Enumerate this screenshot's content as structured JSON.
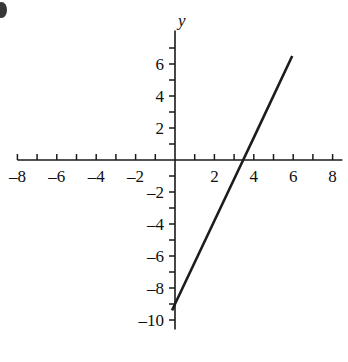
{
  "figure": {
    "corner_mark": "partial-label-cutoff"
  },
  "chart_data": {
    "type": "line",
    "title": "",
    "subtitle": "",
    "xlabel": "x",
    "ylabel": "y",
    "xlim": [
      -8.8,
      8.6
    ],
    "ylim": [
      -10.6,
      7.2
    ],
    "grid": false,
    "legend": null,
    "x_ticks_major": [
      -8,
      -6,
      -4,
      -2,
      2,
      4,
      6,
      8
    ],
    "y_ticks_major": [
      6,
      4,
      2,
      -2,
      -4,
      -6,
      -8,
      -10
    ],
    "x_tick_labels": [
      "–8",
      "–6",
      "–4",
      "–2",
      "2",
      "4",
      "6",
      "8"
    ],
    "y_tick_labels": [
      "6",
      "4",
      "2",
      "–2",
      "–4",
      "–6",
      "–8",
      "–10"
    ],
    "x_tick_step_minor": 1,
    "y_tick_step_minor": 1,
    "series": [
      {
        "name": "line",
        "slope": 2.6,
        "y_intercept": -9,
        "x_intercept": 3.46,
        "x_start": -0.15,
        "y_start": -9.4,
        "x_end": 5.95,
        "y_end": 6.5,
        "points": [
          {
            "x": -0.15,
            "y": -9.4
          },
          {
            "x": 0,
            "y": -9
          },
          {
            "x": 2,
            "y": -3.8
          },
          {
            "x": 3.46,
            "y": 0
          },
          {
            "x": 4,
            "y": 1.4
          },
          {
            "x": 5.95,
            "y": 6.5
          }
        ]
      }
    ],
    "axes": {
      "x_axis_draw_from": -8.0,
      "x_axis_draw_to": 8.5,
      "y_axis_draw_from": -10.6,
      "y_axis_draw_to": 8.1
    }
  }
}
